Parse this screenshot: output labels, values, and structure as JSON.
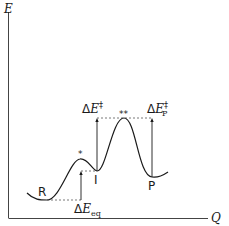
{
  "diagram": {
    "axes": {
      "y_label": "E",
      "x_label": "Q"
    },
    "states": [
      {
        "id": "R",
        "label": "R"
      },
      {
        "id": "I",
        "label": "I"
      },
      {
        "id": "P",
        "label": "P"
      }
    ],
    "transition_markers": [
      {
        "id": "ts1",
        "label": "*"
      },
      {
        "id": "ts2",
        "label": "**"
      }
    ],
    "energy_labels": {
      "eq": {
        "delta": "Δ",
        "symbol": "E",
        "sub": "eq",
        "sup": ""
      },
      "i_barrier": {
        "delta": "Δ",
        "symbol": "E",
        "sub": "I",
        "sup": "‡"
      },
      "p_barrier": {
        "delta": "Δ",
        "symbol": "E",
        "sub": "P",
        "sup": "‡"
      }
    },
    "colors": {
      "line": "#1a1a1a",
      "dashed": "#555555",
      "background": "#ffffff"
    }
  }
}
